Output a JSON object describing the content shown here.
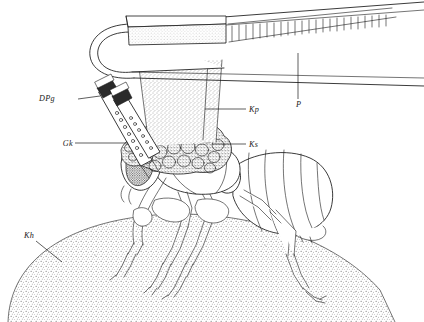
{
  "figure": {
    "kind": "scientific-line-drawing",
    "width": 424,
    "height": 322,
    "background_color": "#ffffff",
    "ink_color": "#181818",
    "stipple_color": "#4a4a4a"
  },
  "labels": [
    {
      "id": "dpg",
      "text": "DPg",
      "x": 55,
      "y": 101,
      "leader": "M 78 99 L 100 96",
      "points_to": "applicator-tube-cap-upper"
    },
    {
      "id": "gk",
      "text": "Gk",
      "x": 57,
      "y": 146,
      "leader": "M 75 143 L 128 143",
      "points_to": "applicator-tube-lower"
    },
    {
      "id": "kp",
      "text": "Kp",
      "x": 249,
      "y": 112,
      "leader": "M 246 109 L 205 109",
      "points_to": "stippled-column"
    },
    {
      "id": "ks",
      "text": "Ks",
      "x": 249,
      "y": 147,
      "leader": "M 246 144 L 212 144",
      "points_to": "granule-cluster"
    },
    {
      "id": "p",
      "text": "P",
      "x": 296,
      "y": 107,
      "leader": "M 298 99 L 298 53",
      "points_to": "forceps-arm"
    },
    {
      "id": "kh",
      "text": "Kh",
      "x": 24,
      "y": 238,
      "leader": "M 36 241 L 62 262",
      "points_to": "substrate-dome"
    }
  ],
  "parts": {
    "forceps": {
      "name": "forceps",
      "label_ref": "P",
      "description": "tapering two-armed forceps with serrated grip plate entering from upper right"
    },
    "grip_plate": {
      "name": "grip-plate",
      "description": "shaded rectangular handle block at the forceps base"
    },
    "column": {
      "name": "stippled-column",
      "label_ref": "Kp",
      "description": "stippled trapezoid column descending from forceps loop to insect head"
    },
    "granules": {
      "name": "granule-cluster",
      "label_ref": "Ks",
      "description": "mass of rounded stippled granules atop the insect head and thorax"
    },
    "applicator_upper": {
      "name": "applicator-tube-upper",
      "label_ref": "DPg",
      "description": "capped cylindrical tube angled down-right with dark tip"
    },
    "applicator_lower": {
      "name": "applicator-tube-lower",
      "label_ref": "Gk",
      "description": "second capped cylindrical tube with beaded graduation marks"
    },
    "insect": {
      "name": "insect",
      "description": "ant in left-facing lateral view with stippled eye, segmented legs and banded gaster"
    },
    "substrate": {
      "name": "substrate-dome",
      "label_ref": "Kh",
      "description": "stippled convex dome forming the ground surface"
    }
  }
}
